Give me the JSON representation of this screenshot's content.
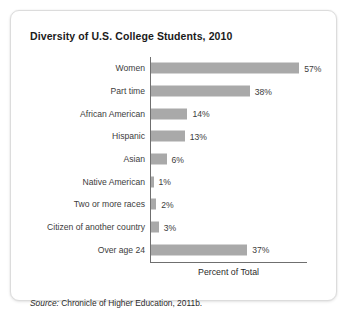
{
  "card": {
    "title": "Diversity of U.S. College Students, 2010",
    "source_lead": "Source:",
    "source_text": "Chronicle of Higher Education, 2011b."
  },
  "colors": {
    "bar": "#a9a9a9",
    "axis": "#6f6f6f",
    "card_border": "#dcdcdc",
    "title_text": "#1b1b1b",
    "label_text": "#3c3c3c",
    "page_background": "#ffffff"
  },
  "chart_data": {
    "type": "bar",
    "orientation": "horizontal",
    "title": "Diversity of U.S. College Students, 2010",
    "xlabel": "Percent of Total",
    "ylabel": "",
    "xlim": [
      0,
      60
    ],
    "grid": false,
    "legend": null,
    "value_suffix": "%",
    "categories": [
      "Women",
      "Part time",
      "African American",
      "Hispanic",
      "Asian",
      "Native American",
      "Two or more races",
      "Citizen of another country",
      "Over age 24"
    ],
    "values": [
      57,
      38,
      14,
      13,
      6,
      1,
      2,
      3,
      37
    ],
    "value_labels": [
      "57%",
      "38%",
      "14%",
      "13%",
      "6%",
      "1%",
      "2%",
      "3%",
      "37%"
    ],
    "source": "Source: Chronicle of Higher Education, 2011b."
  }
}
